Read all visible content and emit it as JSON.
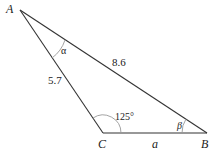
{
  "diagram": {
    "type": "triangle",
    "vertices": {
      "A": {
        "label": "A"
      },
      "B": {
        "label": "B"
      },
      "C": {
        "label": "C"
      }
    },
    "sides": {
      "AC": {
        "label": "5.7"
      },
      "AB": {
        "label": "8.6"
      },
      "CB": {
        "label": "a"
      }
    },
    "angles": {
      "A": {
        "label": "α"
      },
      "B": {
        "label": "β"
      },
      "C": {
        "label": "125°"
      }
    },
    "colors": {
      "line": "#333333",
      "arc": "#999999",
      "text": "#222222"
    }
  }
}
